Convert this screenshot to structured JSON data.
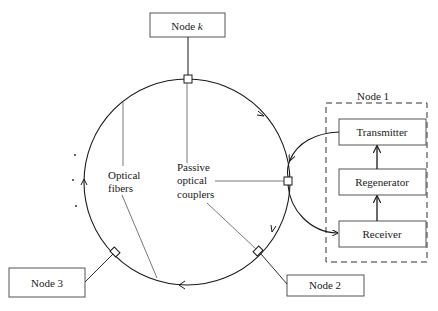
{
  "diagram": {
    "type": "optical-ring-network",
    "nodes": {
      "node_k": {
        "label": "Node ",
        "label_italic": "k"
      },
      "node_1": {
        "label": "Node 1"
      },
      "node_2": {
        "label": "Node 2"
      },
      "node_3": {
        "label": "Node 3"
      }
    },
    "node1_components": {
      "transmitter": "Transmitter",
      "regenerator": "Regenerator",
      "receiver": "Receiver"
    },
    "annotations": {
      "optical_fibers": [
        "Optical",
        "fibers"
      ],
      "passive_couplers": [
        "Passive",
        "optical",
        "couplers"
      ]
    },
    "ellipsis_dots": [
      ".",
      ".",
      "."
    ],
    "colors": {
      "line": "#1a1a1a",
      "background": "#ffffff",
      "box_border": "#333333"
    }
  }
}
